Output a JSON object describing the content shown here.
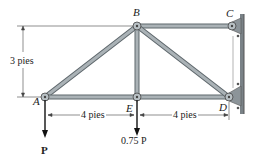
{
  "diagram": {
    "type": "truss",
    "joints": [
      {
        "id": "A",
        "label": "A",
        "x": 45,
        "y": 97
      },
      {
        "id": "B",
        "label": "B",
        "x": 137,
        "y": 26
      },
      {
        "id": "C",
        "label": "C",
        "x": 232,
        "y": 26
      },
      {
        "id": "D",
        "label": "D",
        "x": 229,
        "y": 97
      },
      {
        "id": "E",
        "label": "E",
        "x": 137,
        "y": 97
      }
    ],
    "members": [
      [
        "A",
        "B"
      ],
      [
        "B",
        "C"
      ],
      [
        "A",
        "E"
      ],
      [
        "E",
        "D"
      ],
      [
        "B",
        "E"
      ],
      [
        "B",
        "D"
      ]
    ],
    "dimensions": {
      "height": "3 pies",
      "span_left": "4 pies",
      "span_right": "4 pies"
    },
    "loads": {
      "at_A": "P",
      "at_E": "0.75 P"
    },
    "colors": {
      "member": "#9aa3a8",
      "member_edge": "#5f686d",
      "wall": "#6e767b",
      "line": "#333333"
    }
  }
}
